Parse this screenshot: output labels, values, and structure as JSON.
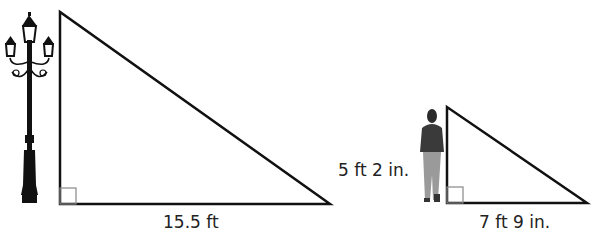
{
  "figures": [
    {
      "object": "lamppost-icon",
      "triangle": {
        "shadow_label": "15.5 ft",
        "height_label": ""
      },
      "right_angle": true
    },
    {
      "object": "person-icon",
      "triangle": {
        "shadow_label": "7 ft 9 in.",
        "height_label": "5 ft 2 in."
      },
      "right_angle": true
    }
  ],
  "colors": {
    "stroke": "#111111",
    "right_angle_mark": "#888888",
    "person_top": "#3a3a3a",
    "person_pants": "#9a9a9a"
  }
}
